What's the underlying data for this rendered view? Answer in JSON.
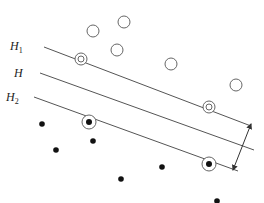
{
  "diagram": {
    "title": "",
    "labels": {
      "h1": "H",
      "h1_sub": "1",
      "h": "H",
      "h2": "H",
      "h2_sub": "2"
    },
    "colors": {
      "line": "#555555",
      "point_stroke": "#666666",
      "dot": "#111111"
    },
    "lines": [
      {
        "name": "H1",
        "x1": 44,
        "y1": 47,
        "x2": 251,
        "y2": 126
      },
      {
        "name": "H",
        "x1": 40,
        "y1": 73,
        "x2": 254,
        "y2": 150
      },
      {
        "name": "H2",
        "x1": 34,
        "y1": 97,
        "x2": 238,
        "y2": 171
      }
    ],
    "open_points": [
      [
        93,
        31
      ],
      [
        124,
        22
      ],
      [
        117,
        50
      ],
      [
        171,
        64
      ],
      [
        236,
        85
      ]
    ],
    "open_support_vectors": [
      [
        81,
        59
      ],
      [
        209,
        107
      ]
    ],
    "filled_points": [
      [
        42,
        124
      ],
      [
        56,
        150
      ],
      [
        93,
        141
      ],
      [
        121,
        179
      ],
      [
        162,
        167
      ],
      [
        217,
        201
      ]
    ],
    "filled_support_vectors": [
      [
        89,
        122
      ],
      [
        209,
        164
      ]
    ],
    "margin_arrow": {
      "x1": 251,
      "y1": 124,
      "x2": 233,
      "y2": 170
    }
  }
}
